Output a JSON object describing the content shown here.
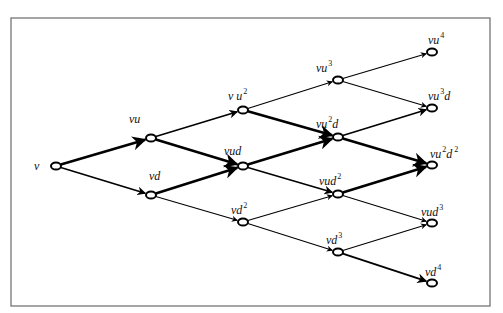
{
  "diagram": {
    "type": "binomial-lattice",
    "frame": {
      "x": 11,
      "y": 18,
      "w": 479,
      "h": 288
    },
    "nodes": [
      {
        "id": "v",
        "x": 56,
        "y": 166,
        "label": "v",
        "sup1": "",
        "mid": "",
        "sup2": "",
        "lx": 34,
        "ly": 170
      },
      {
        "id": "vu",
        "x": 151,
        "y": 138,
        "label": "vu",
        "sup1": "",
        "mid": "",
        "sup2": "",
        "lx": 129,
        "ly": 123
      },
      {
        "id": "vd",
        "x": 151,
        "y": 195,
        "label": "vd",
        "sup1": "",
        "mid": "",
        "sup2": "",
        "lx": 149,
        "ly": 180
      },
      {
        "id": "vu2",
        "x": 243,
        "y": 110,
        "label": "v u",
        "sup1": "2",
        "mid": "",
        "sup2": "",
        "lx": 228,
        "ly": 100
      },
      {
        "id": "vud",
        "x": 243,
        "y": 166,
        "label": "vud",
        "sup1": "",
        "mid": "",
        "sup2": "",
        "lx": 224,
        "ly": 155
      },
      {
        "id": "vd2",
        "x": 243,
        "y": 222,
        "label": "vd",
        "sup1": "2",
        "mid": "",
        "sup2": "",
        "lx": 231,
        "ly": 214
      },
      {
        "id": "vu3",
        "x": 338,
        "y": 80,
        "label": "vu",
        "sup1": "3",
        "mid": "",
        "sup2": "",
        "lx": 316,
        "ly": 72
      },
      {
        "id": "vu2d",
        "x": 338,
        "y": 137,
        "label": "vu",
        "sup1": "2",
        "mid": "d",
        "sup2": "",
        "lx": 316,
        "ly": 128
      },
      {
        "id": "vud2",
        "x": 338,
        "y": 194,
        "label": "vud",
        "sup1": "2",
        "mid": "",
        "sup2": "",
        "lx": 319,
        "ly": 185
      },
      {
        "id": "vd3",
        "x": 338,
        "y": 252,
        "label": "vd",
        "sup1": "3",
        "mid": "",
        "sup2": "",
        "lx": 326,
        "ly": 244
      },
      {
        "id": "vu4",
        "x": 432,
        "y": 52,
        "label": "vu",
        "sup1": "4",
        "mid": "",
        "sup2": "",
        "lx": 428,
        "ly": 44
      },
      {
        "id": "vu3d",
        "x": 432,
        "y": 108,
        "label": "vu",
        "sup1": "3",
        "mid": "d",
        "sup2": "",
        "lx": 428,
        "ly": 100
      },
      {
        "id": "vu2d2",
        "x": 432,
        "y": 165,
        "label": "vu",
        "sup1": "2",
        "mid": "d",
        "sup2": "2",
        "lx": 430,
        "ly": 158
      },
      {
        "id": "vud3",
        "x": 432,
        "y": 223,
        "label": "vud",
        "sup1": "3",
        "mid": "",
        "sup2": "",
        "lx": 421,
        "ly": 216
      },
      {
        "id": "vd4",
        "x": 432,
        "y": 283,
        "label": "vd",
        "sup1": "4",
        "mid": "",
        "sup2": "",
        "lx": 425,
        "ly": 276
      }
    ],
    "edges": [
      {
        "from": "v",
        "to": "vu",
        "weight": 2.6
      },
      {
        "from": "v",
        "to": "vd",
        "weight": 1.6
      },
      {
        "from": "vu",
        "to": "vu2",
        "weight": 1.6
      },
      {
        "from": "vu",
        "to": "vud",
        "weight": 2.6
      },
      {
        "from": "vd",
        "to": "vud",
        "weight": 2.6
      },
      {
        "from": "vd",
        "to": "vd2",
        "weight": 1.1
      },
      {
        "from": "vu2",
        "to": "vu3",
        "weight": 1.1
      },
      {
        "from": "vu2",
        "to": "vu2d",
        "weight": 2.6
      },
      {
        "from": "vud",
        "to": "vu2d",
        "weight": 2.6
      },
      {
        "from": "vud",
        "to": "vud2",
        "weight": 1.6
      },
      {
        "from": "vd2",
        "to": "vud2",
        "weight": 1.1
      },
      {
        "from": "vd2",
        "to": "vd3",
        "weight": 1.1
      },
      {
        "from": "vu3",
        "to": "vu4",
        "weight": 1.1
      },
      {
        "from": "vu3",
        "to": "vu3d",
        "weight": 1.1
      },
      {
        "from": "vu2d",
        "to": "vu3d",
        "weight": 1.6
      },
      {
        "from": "vu2d",
        "to": "vu2d2",
        "weight": 2.6
      },
      {
        "from": "vud2",
        "to": "vu2d2",
        "weight": 2.6
      },
      {
        "from": "vud2",
        "to": "vud3",
        "weight": 1.1
      },
      {
        "from": "vd3",
        "to": "vud3",
        "weight": 1.1
      },
      {
        "from": "vd3",
        "to": "vd4",
        "weight": 1.8
      }
    ],
    "colors": {
      "line": "#000000",
      "frame": "#6a6a6a",
      "background": "#ffffff"
    }
  }
}
